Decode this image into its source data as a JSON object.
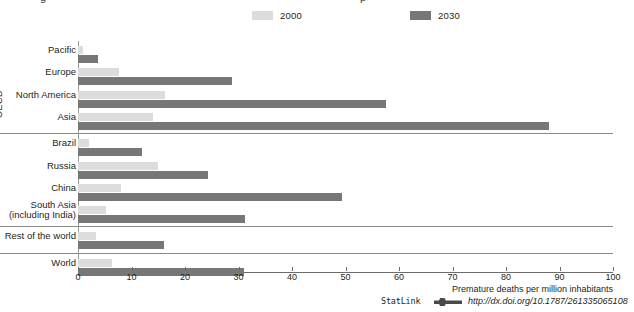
{
  "title_fragment_left": "g",
  "title_fragment_right": "p",
  "legend": [
    {
      "label": "2000",
      "color": "#dcdcdc",
      "name": "legend-2000"
    },
    {
      "label": "2030",
      "color": "#777777",
      "name": "legend-2030"
    }
  ],
  "group_label": "OECD",
  "xaxis": {
    "title": "Premature deaths per million inhabitants",
    "ticks": [
      "0",
      "10",
      "20",
      "30",
      "40",
      "50",
      "60",
      "70",
      "80",
      "90",
      "100"
    ]
  },
  "statlink": {
    "word": "StatLink",
    "url": "http://dx.doi.org/10.1787/261335065108"
  },
  "chart_data": {
    "type": "bar",
    "orientation": "horizontal",
    "title": "Premature deaths per million inhabitants",
    "xlabel": "Premature deaths per million inhabitants",
    "ylabel": "",
    "xlim": [
      0,
      100
    ],
    "grid": false,
    "legend_position": "top",
    "categories": [
      "Pacific",
      "Europe",
      "North America",
      "Asia",
      "Brazil",
      "Russia",
      "China",
      "South Asia\n(including India)",
      "Rest of the world",
      "World"
    ],
    "series": [
      {
        "name": "2000",
        "color": "#dcdcdc",
        "values": [
          1.0,
          7.7,
          16.2,
          14.0,
          2.0,
          15.0,
          8.0,
          5.2,
          3.4,
          6.4
        ]
      },
      {
        "name": "2030",
        "color": "#777777",
        "values": [
          3.8,
          28.8,
          57.5,
          88.0,
          12.0,
          24.3,
          49.3,
          31.3,
          16.0,
          31.0
        ]
      }
    ],
    "groups": [
      {
        "label": "OECD",
        "categories": [
          "Pacific",
          "Europe",
          "North America",
          "Asia"
        ]
      },
      {
        "label": "",
        "categories": [
          "Brazil",
          "Russia",
          "China",
          "South Asia\n(including India)"
        ]
      },
      {
        "label": "",
        "categories": [
          "Rest of the world"
        ]
      },
      {
        "label": "",
        "categories": [
          "World"
        ]
      }
    ]
  }
}
